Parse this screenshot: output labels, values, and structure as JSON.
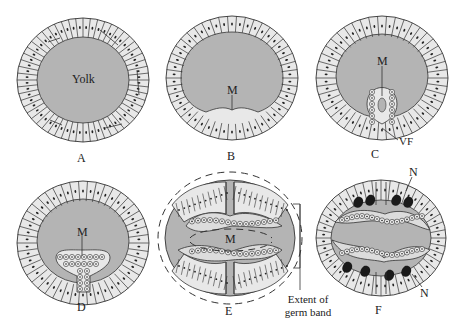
{
  "figure": {
    "colors": {
      "yolk": "#b4b4b4",
      "cell": "#e8e8e8",
      "outline": "#333333",
      "nucleus": "#222222",
      "background": "#ffffff"
    },
    "panels": [
      {
        "id": "A",
        "label": "A",
        "annotations": [
          {
            "text": "Yolk"
          }
        ]
      },
      {
        "id": "B",
        "label": "B",
        "annotations": [
          {
            "text": "M"
          }
        ]
      },
      {
        "id": "C",
        "label": "C",
        "annotations": [
          {
            "text": "M"
          },
          {
            "text": "VF"
          }
        ]
      },
      {
        "id": "D",
        "label": "D",
        "annotations": [
          {
            "text": "M"
          }
        ]
      },
      {
        "id": "E",
        "label": "E",
        "annotations": [
          {
            "text": "M"
          },
          {
            "text": "Extent of germ band"
          }
        ]
      },
      {
        "id": "F",
        "label": "F",
        "annotations": [
          {
            "text": "N"
          },
          {
            "text": "N"
          }
        ]
      }
    ]
  }
}
